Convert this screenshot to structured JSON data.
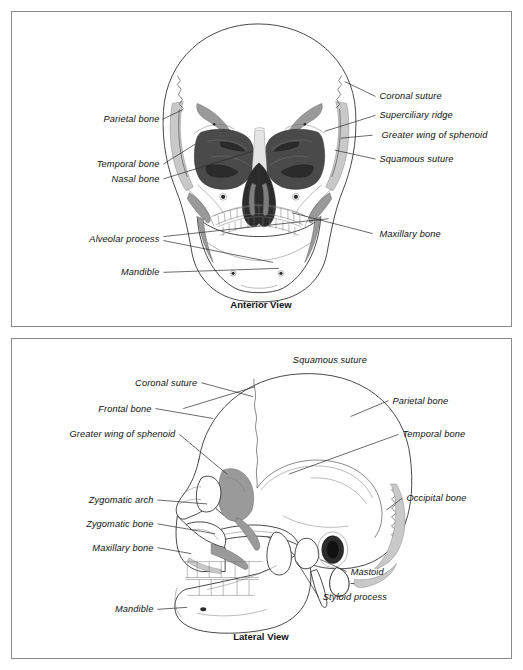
{
  "document": {
    "title": "Skull Anatomy Reference",
    "panel_count": 2
  },
  "panels": [
    {
      "id": "anterior",
      "caption": "Anterior View",
      "labels_left": [
        {
          "key": "parietal_bone",
          "text": "Parietal bone"
        },
        {
          "key": "temporal_bone",
          "text": "Temporal bone"
        },
        {
          "key": "nasal_bone",
          "text": "Nasal bone"
        },
        {
          "key": "alveolar_process",
          "text": "Alveolar process"
        },
        {
          "key": "mandible",
          "text": "Mandible"
        }
      ],
      "labels_right": [
        {
          "key": "coronal_suture",
          "text": "Coronal suture"
        },
        {
          "key": "superciliary_ridge",
          "text": "Superciliary ridge"
        },
        {
          "key": "greater_wing_of_sphenoid",
          "text": "Greater wing of sphenoid"
        },
        {
          "key": "squamous_suture",
          "text": "Squamous suture"
        },
        {
          "key": "maxillary_bone",
          "text": "Maxillary bone"
        }
      ]
    },
    {
      "id": "lateral",
      "caption": "Lateral View",
      "labels_left": [
        {
          "key": "coronal_suture",
          "text": "Coronal suture"
        },
        {
          "key": "frontal_bone",
          "text": "Frontal bone"
        },
        {
          "key": "greater_wing_of_sphenoid",
          "text": "Greater wing of sphenoid"
        },
        {
          "key": "zygomatic_arch",
          "text": "Zygomatic arch"
        },
        {
          "key": "zygomatic_bone",
          "text": "Zygomatic bone"
        },
        {
          "key": "maxillary_bone",
          "text": "Maxillary bone"
        },
        {
          "key": "mandible",
          "text": "Mandible"
        }
      ],
      "labels_top": [
        {
          "key": "squamous_suture",
          "text": "Squamous suture"
        }
      ],
      "labels_right": [
        {
          "key": "parietal_bone",
          "text": "Parietal bone"
        },
        {
          "key": "temporal_bone",
          "text": "Temporal bone"
        },
        {
          "key": "occipital_bone",
          "text": "Occipital bone"
        },
        {
          "key": "mastoid",
          "text": "Mastoid"
        },
        {
          "key": "styloid_process",
          "text": "Styloid process"
        }
      ]
    }
  ],
  "colors": {
    "panel_border": "#8a8a8a",
    "outline": "#333333",
    "label_text": "#111111",
    "leader_line": "#2a2a2a",
    "orbit_fill": "#4a4a4a",
    "nasal_fill": "#2b2b2b",
    "shade_mid": "#9a9a9a",
    "shade_light": "#c9c9c9",
    "background": "#ffffff"
  }
}
